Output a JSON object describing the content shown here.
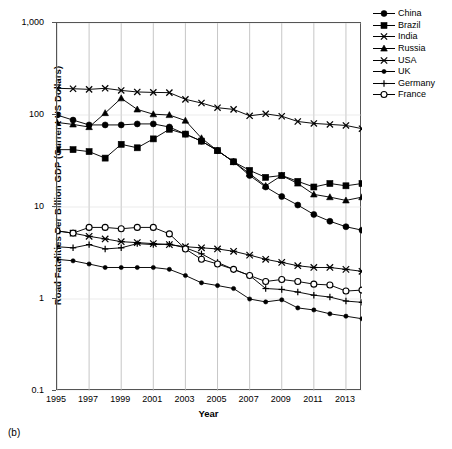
{
  "figure": {
    "caption": "(b)"
  },
  "axes": {
    "ylabel": "Road Fatalities Per Billion GDP (Current US Dollars)",
    "xlabel": "Year",
    "ytick_labels": [
      "1,000",
      "100",
      "10",
      "1",
      "0.1"
    ],
    "xtick_labels": [
      "1995",
      "1997",
      "1999",
      "2001",
      "2003",
      "2005",
      "2007",
      "2009",
      "2011",
      "2013"
    ]
  },
  "legend": {
    "items": [
      {
        "label": "China",
        "marker": "filled-circle"
      },
      {
        "label": "Brazil",
        "marker": "filled-square"
      },
      {
        "label": "India",
        "marker": "cross-x"
      },
      {
        "label": "Russia",
        "marker": "filled-triangle"
      },
      {
        "label": "USA",
        "marker": "asterisk-star"
      },
      {
        "label": "UK",
        "marker": "small-filled-circle"
      },
      {
        "label": "Germany",
        "marker": "plus"
      },
      {
        "label": "France",
        "marker": "open-circle"
      }
    ]
  },
  "chart_data": {
    "type": "line",
    "title": "",
    "xlabel": "Year",
    "ylabel": "Road Fatalities Per Billion GDP (Current US Dollars)",
    "yscale": "log",
    "ylim": [
      0.1,
      1000
    ],
    "xlim": [
      1995,
      2014
    ],
    "grid": "vertical-only",
    "legend_position": "right-outside",
    "x": [
      1995,
      1996,
      1997,
      1998,
      1999,
      2000,
      2001,
      2002,
      2003,
      2004,
      2005,
      2006,
      2007,
      2008,
      2009,
      2010,
      2011,
      2012,
      2013,
      2014
    ],
    "series": [
      {
        "name": "China",
        "marker": "filled-circle",
        "values": [
          100,
          88,
          78,
          78,
          78,
          80,
          80,
          74,
          62,
          52,
          41,
          31,
          22,
          16.5,
          13,
          10.5,
          8.3,
          7.0,
          6.1,
          5.6
        ]
      },
      {
        "name": "Brazil",
        "marker": "filled-square",
        "values": [
          42,
          42,
          40,
          34,
          48,
          44,
          55,
          70,
          62,
          52,
          41,
          31,
          25,
          21,
          22,
          19,
          16.5,
          18,
          17,
          18
        ]
      },
      {
        "name": "India",
        "marker": "cross-x",
        "values": [
          195,
          193,
          190,
          195,
          185,
          178,
          176,
          175,
          148,
          135,
          120,
          115,
          98,
          103,
          97,
          85,
          81,
          79,
          77,
          71
        ]
      },
      {
        "name": "Russia",
        "marker": "filled-triangle",
        "values": [
          83,
          79,
          74,
          105,
          152,
          115,
          102,
          100,
          87,
          56,
          41,
          31,
          23,
          17,
          22,
          18,
          13.7,
          12.8,
          11.8,
          12.8
        ]
      },
      {
        "name": "USA",
        "marker": "asterisk-star",
        "values": [
          5.5,
          5.2,
          4.8,
          4.5,
          4.2,
          4.1,
          4.0,
          3.9,
          3.7,
          3.6,
          3.5,
          3.3,
          3.0,
          2.7,
          2.5,
          2.3,
          2.2,
          2.2,
          2.1,
          2.0
        ]
      },
      {
        "name": "UK",
        "marker": "small-filled-circle",
        "values": [
          2.7,
          2.6,
          2.4,
          2.2,
          2.2,
          2.2,
          2.2,
          2.1,
          1.8,
          1.5,
          1.4,
          1.3,
          1.0,
          0.93,
          0.98,
          0.8,
          0.76,
          0.69,
          0.65,
          0.61
        ]
      },
      {
        "name": "Germany",
        "marker": "plus",
        "values": [
          3.7,
          3.6,
          3.9,
          3.5,
          3.6,
          4.0,
          3.9,
          3.95,
          3.6,
          3.1,
          2.5,
          2.1,
          1.8,
          1.3,
          1.27,
          1.19,
          1.1,
          1.05,
          0.95,
          0.92
        ]
      },
      {
        "name": "France",
        "marker": "open-circle",
        "values": [
          5.5,
          5.2,
          6.0,
          6.0,
          5.8,
          6.0,
          6.0,
          5.1,
          3.5,
          2.7,
          2.4,
          2.1,
          1.8,
          1.55,
          1.63,
          1.55,
          1.45,
          1.42,
          1.22,
          1.25
        ]
      }
    ]
  }
}
